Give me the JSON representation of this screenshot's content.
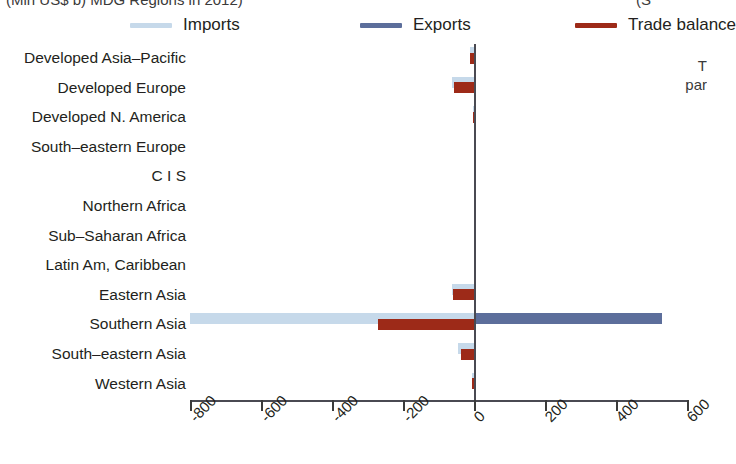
{
  "figure": {
    "title_fragment_left": "(Mln US$ b) MDG Regions in 2012)",
    "title_fragment_right": "(S",
    "side_caption_line1": "T",
    "side_caption_line2": "par"
  },
  "legend": [
    {
      "key": "imports",
      "label": "Imports",
      "color": "#c6d9ea"
    },
    {
      "key": "exports",
      "label": "Exports",
      "color": "#5c6e9b"
    },
    {
      "key": "balance",
      "label": "Trade balance",
      "color": "#9d2a18"
    }
  ],
  "axis": {
    "ticks": [
      "-800",
      "-600",
      "-400",
      "-200",
      "0",
      "200",
      "400",
      "600"
    ],
    "tick_values": [
      -800,
      -600,
      -400,
      -200,
      0,
      200,
      400,
      600
    ]
  },
  "chart_data": {
    "type": "bar",
    "orientation": "horizontal",
    "title": "(Mln US$ b) MDG Regions in 2012)",
    "xlabel": "",
    "ylabel": "",
    "xlim": [
      -800,
      600
    ],
    "grid": false,
    "legend_position": "top",
    "categories": [
      "Developed Asia–Pacific",
      "Developed Europe",
      "Developed N. America",
      "South–eastern Europe",
      "C I S",
      "Northern Africa",
      "Sub–Saharan Africa",
      "Latin Am, Caribbean",
      "Eastern Asia",
      "Southern Asia",
      "South–eastern Asia",
      "Western Asia"
    ],
    "series": [
      {
        "name": "Imports",
        "color": "#c6d9ea",
        "values": [
          -10,
          -62,
          -4,
          0,
          0,
          0,
          0,
          0,
          -62,
          -800,
          -44,
          -6
        ]
      },
      {
        "name": "Exports",
        "color": "#5c6e9b",
        "values": [
          0,
          0,
          0,
          0,
          0,
          0,
          0,
          0,
          0,
          530,
          0,
          0
        ]
      },
      {
        "name": "Trade balance",
        "color": "#9d2a18",
        "values": [
          -10,
          -55,
          -3,
          0,
          0,
          0,
          0,
          0,
          -58,
          -270,
          -38,
          -5
        ]
      }
    ]
  }
}
